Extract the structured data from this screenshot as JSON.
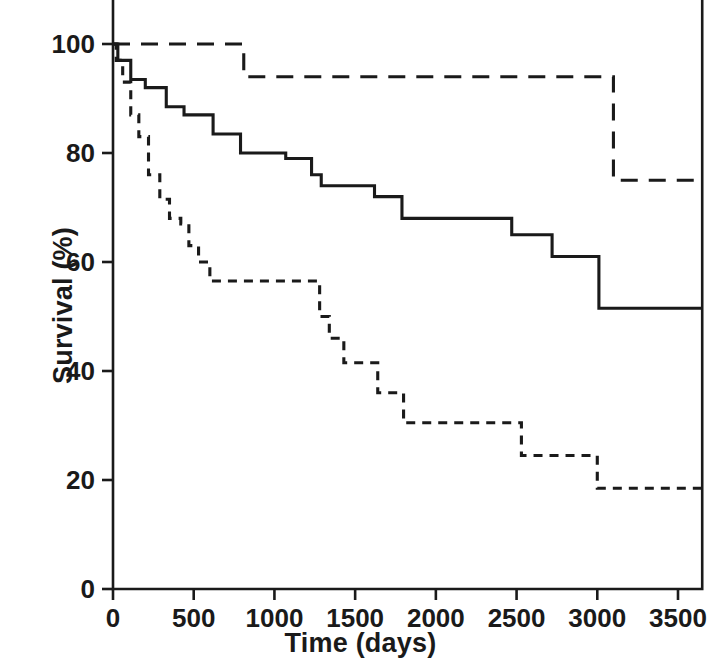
{
  "figure": {
    "title": "",
    "background_color": "#ffffff",
    "line_color": "#1a1a1a"
  },
  "chart_data": {
    "type": "line",
    "subtype": "kaplan-meier-step",
    "title": "",
    "subtitle": "",
    "xlabel": "Time (days)",
    "ylabel": "Survival (%)",
    "xlim": [
      0,
      3650
    ],
    "ylim": [
      0,
      110
    ],
    "xticks": [
      0,
      500,
      1000,
      1500,
      2000,
      2500,
      3000,
      3500
    ],
    "xticklabels": [
      "0",
      "500",
      "1000",
      "1500",
      "2000",
      "2500",
      "3000",
      "3500"
    ],
    "yticks": [
      0,
      20,
      40,
      60,
      80,
      100
    ],
    "yticklabels": [
      "0",
      "20",
      "40",
      "60",
      "80",
      "100"
    ],
    "grid": false,
    "legend": false,
    "legend_position": "none",
    "annotations": [],
    "series": [
      {
        "name": "Upper curve (long dashed)",
        "style": "long-dashed",
        "color": "#1a1a1a",
        "x": [
          0,
          810,
          810,
          3100,
          3100,
          3650
        ],
        "y": [
          100,
          100,
          94,
          94,
          75,
          75
        ],
        "steps": [
          {
            "t": 0,
            "survival": 100
          },
          {
            "t": 810,
            "survival": 94
          },
          {
            "t": 3100,
            "survival": 75
          },
          {
            "t": 3650,
            "survival": 75
          }
        ]
      },
      {
        "name": "Middle curve (solid)",
        "style": "solid",
        "color": "#1a1a1a",
        "x": [
          0,
          30,
          30,
          110,
          110,
          200,
          200,
          330,
          330,
          440,
          440,
          620,
          620,
          790,
          790,
          1070,
          1070,
          1230,
          1230,
          1290,
          1290,
          1620,
          1620,
          1790,
          1790,
          2470,
          2470,
          2720,
          2720,
          3010,
          3010,
          3650
        ],
        "y": [
          100,
          100,
          97,
          97,
          93.5,
          93.5,
          92,
          92,
          88.5,
          88.5,
          87,
          87,
          83.5,
          83.5,
          80,
          80,
          79,
          79,
          76,
          76,
          74,
          74,
          72,
          72,
          68,
          68,
          65,
          65,
          61,
          61,
          51.5,
          51.5
        ],
        "steps": [
          {
            "t": 0,
            "survival": 100
          },
          {
            "t": 30,
            "survival": 97
          },
          {
            "t": 110,
            "survival": 93.5
          },
          {
            "t": 200,
            "survival": 92
          },
          {
            "t": 330,
            "survival": 88.5
          },
          {
            "t": 440,
            "survival": 87
          },
          {
            "t": 620,
            "survival": 83.5
          },
          {
            "t": 790,
            "survival": 80
          },
          {
            "t": 1070,
            "survival": 79
          },
          {
            "t": 1230,
            "survival": 76
          },
          {
            "t": 1290,
            "survival": 74
          },
          {
            "t": 1620,
            "survival": 72
          },
          {
            "t": 1790,
            "survival": 68
          },
          {
            "t": 2470,
            "survival": 65
          },
          {
            "t": 2720,
            "survival": 61
          },
          {
            "t": 3010,
            "survival": 51.5
          },
          {
            "t": 3650,
            "survival": 51.5
          }
        ]
      },
      {
        "name": "Lower curve (short dashed)",
        "style": "short-dashed",
        "color": "#1a1a1a",
        "x": [
          0,
          20,
          20,
          60,
          60,
          110,
          110,
          160,
          160,
          220,
          220,
          290,
          290,
          350,
          350,
          420,
          420,
          470,
          470,
          530,
          530,
          600,
          600,
          1230,
          1230,
          1280,
          1280,
          1340,
          1340,
          1430,
          1430,
          1640,
          1640,
          1800,
          1800,
          2470,
          2470,
          2530,
          2530,
          3000,
          3000,
          3650
        ],
        "y": [
          100,
          100,
          97,
          97,
          93,
          93,
          87,
          87,
          83,
          83,
          76,
          76,
          71.5,
          71.5,
          68,
          68,
          67,
          67,
          63,
          63,
          60,
          60,
          56.5,
          56.5,
          56.5,
          56.5,
          50,
          50,
          46,
          46,
          41.5,
          41.5,
          36,
          36,
          30.5,
          30.5,
          30.5,
          30.5,
          24.5,
          24.5,
          18.5,
          18.5
        ],
        "steps": [
          {
            "t": 0,
            "survival": 100
          },
          {
            "t": 20,
            "survival": 97
          },
          {
            "t": 60,
            "survival": 93
          },
          {
            "t": 110,
            "survival": 87
          },
          {
            "t": 160,
            "survival": 83
          },
          {
            "t": 220,
            "survival": 76
          },
          {
            "t": 290,
            "survival": 71.5
          },
          {
            "t": 350,
            "survival": 68
          },
          {
            "t": 420,
            "survival": 67
          },
          {
            "t": 470,
            "survival": 63
          },
          {
            "t": 530,
            "survival": 60
          },
          {
            "t": 600,
            "survival": 56.5
          },
          {
            "t": 1230,
            "survival": 56.5
          },
          {
            "t": 1280,
            "survival": 50
          },
          {
            "t": 1340,
            "survival": 46
          },
          {
            "t": 1430,
            "survival": 41.5
          },
          {
            "t": 1640,
            "survival": 36
          },
          {
            "t": 1800,
            "survival": 30.5
          },
          {
            "t": 2470,
            "survival": 30.5
          },
          {
            "t": 2530,
            "survival": 24.5
          },
          {
            "t": 3000,
            "survival": 18.5
          },
          {
            "t": 3650,
            "survival": 18.5
          }
        ]
      }
    ]
  }
}
